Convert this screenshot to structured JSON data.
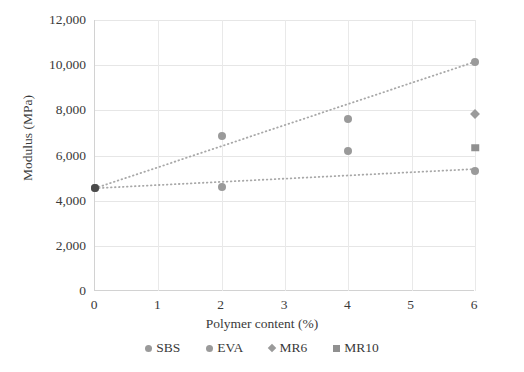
{
  "chart_data": {
    "type": "scatter",
    "title": "",
    "xlabel": "Polymer content (%)",
    "ylabel": "Modulus (MPa)",
    "xlim": [
      0,
      6
    ],
    "ylim": [
      0,
      12000
    ],
    "xticks": [
      "0",
      "1",
      "2",
      "3",
      "4",
      "5",
      "6"
    ],
    "xtick_values": [
      0,
      1,
      2,
      3,
      4,
      5,
      6
    ],
    "yticks": [
      "0",
      "2,000",
      "4,000",
      "6,000",
      "8,000",
      "10,000",
      "12,000"
    ],
    "ytick_values": [
      0,
      2000,
      4000,
      6000,
      8000,
      10000,
      12000
    ],
    "grid": "both",
    "legend_position": "bottom",
    "series": [
      {
        "name": "SBS",
        "marker": "circle",
        "color": "#9a9a9a",
        "points": [
          {
            "x": 0,
            "y": 4550
          },
          {
            "x": 2,
            "y": 6850
          },
          {
            "x": 4,
            "y": 7600
          },
          {
            "x": 6,
            "y": 10150
          }
        ],
        "trendline": {
          "style": "dotted",
          "color": "#a8a8a8",
          "x0": 0,
          "y0": 4550,
          "x1": 6,
          "y1": 10150
        }
      },
      {
        "name": "EVA",
        "marker": "circle",
        "color": "#9a9a9a",
        "points": [
          {
            "x": 0,
            "y": 4550
          },
          {
            "x": 2,
            "y": 4600
          },
          {
            "x": 4,
            "y": 6200
          },
          {
            "x": 6,
            "y": 5300
          }
        ],
        "trendline": {
          "style": "dotted",
          "color": "#a8a8a8",
          "x0": 0,
          "y0": 4550,
          "x1": 6,
          "y1": 5400
        }
      },
      {
        "name": "MR6",
        "marker": "diamond",
        "color": "#9a9a9a",
        "points": [
          {
            "x": 6,
            "y": 7850
          }
        ]
      },
      {
        "name": "MR10",
        "marker": "square",
        "color": "#909090",
        "points": [
          {
            "x": 6,
            "y": 6350
          }
        ]
      },
      {
        "name": "origin",
        "marker": "circle",
        "color": "#4a4a4a",
        "points": [
          {
            "x": 0,
            "y": 4550
          }
        ]
      }
    ],
    "legend": [
      {
        "label": "SBS",
        "marker": "circle",
        "color": "#9a9a9a"
      },
      {
        "label": "EVA",
        "marker": "circle",
        "color": "#9a9a9a"
      },
      {
        "label": "MR6",
        "marker": "diamond",
        "color": "#9a9a9a"
      },
      {
        "label": "MR10",
        "marker": "square",
        "color": "#909090"
      }
    ]
  }
}
